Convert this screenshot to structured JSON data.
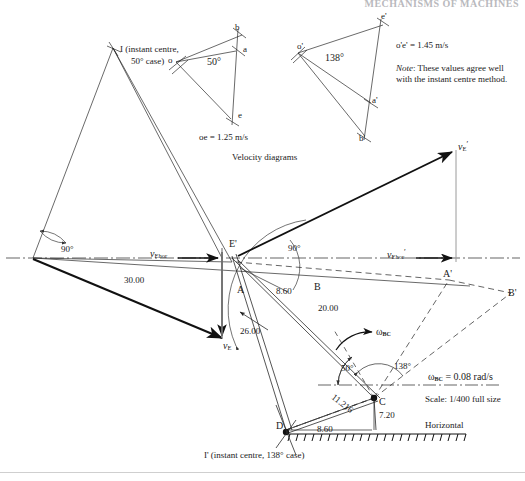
{
  "page": {
    "header_running_text": "MECHANISMS OF MACHINES",
    "caption_velocity": "Velocity diagrams",
    "scale_note": "Scale: 1/400 full size",
    "horizontal_label": "Horizontal"
  },
  "velocity_diagram_left": {
    "points": [
      "o",
      "a",
      "b",
      "e"
    ],
    "angle": "50°",
    "magnitude_label": "oe = 1.25 m/s"
  },
  "velocity_diagram_right": {
    "points": [
      "o'",
      "a'",
      "b'",
      "e'"
    ],
    "angle": "138°",
    "magnitude_label": "o'e' = 1.45 m/s"
  },
  "note": {
    "lead": "Note",
    "text": ": These values agree well with the instant centre method."
  },
  "instant_centres": {
    "upper_label_line1": "I (instant centre,",
    "upper_label_line2": "50° case)",
    "lower_label": "I' (instant centre, 138° case)"
  },
  "mechanism_labels": {
    "point_A": "A",
    "point_B": "B",
    "point_C": "C",
    "point_D": "D",
    "point_E_prime": "E'",
    "point_A_prime": "A'",
    "point_B_prime": "B'"
  },
  "dimensions": {
    "d_30": "30.00",
    "d_26": "26.00",
    "d_20": "20.00",
    "d_860_upper": "8.60",
    "d_860_lower": "8.60",
    "d_720": "7.20",
    "d_11216": "11.216"
  },
  "angles": {
    "left_90": "90°",
    "mid_90": "90°",
    "crank_50": "50°",
    "crank_138": "138°"
  },
  "vectors": {
    "vE": "v",
    "vE_sub": "E",
    "vEhor": "v",
    "vEhor_sub": "Ehor",
    "vE_prime": "v",
    "vE_prime_sub": "E",
    "vEhor_prime": "v",
    "vEhor_prime_sub": "Ehor"
  },
  "omega": {
    "symbol": "ω",
    "subscript": "BC",
    "value_label": "ω",
    "value_sub": "BC",
    "value_text": " = 0.08 rad/s"
  }
}
